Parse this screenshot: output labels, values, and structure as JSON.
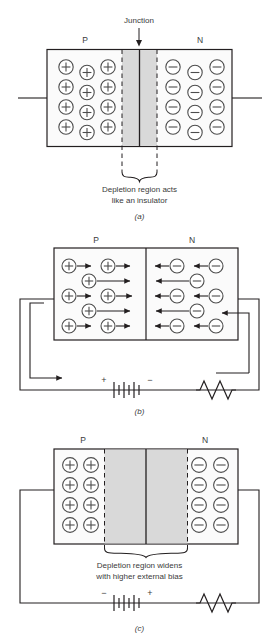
{
  "figure": {
    "colors": {
      "ink": "#231f20",
      "text": "#3a3a3a",
      "carrier_stroke": "#4d4d4d",
      "depletion_fill": "#d9d9d9",
      "body_fill": "#fbfbfb",
      "background": "#ffffff"
    },
    "panels": [
      {
        "id": "a",
        "panel_label": "(a)",
        "p_label": "P",
        "n_label": "N",
        "junction_label": "Junction",
        "junction_arrow": "down-arrow-icon",
        "caption_line1": "Depletion region acts",
        "caption_line2": "like an insulator",
        "brace": "curly-brace-down-icon",
        "p_carrier_symbol": "+",
        "n_carrier_symbol": "−",
        "p_carrier_count": 12,
        "n_carrier_count": 12,
        "p_carrier_rows": 4,
        "p_carrier_cols": 3,
        "has_arrows": false,
        "has_battery": false,
        "has_resistor": false,
        "depletion_width": "narrow",
        "leads": "two horizontal leads, left and right"
      },
      {
        "id": "b",
        "panel_label": "(b)",
        "p_label": "P",
        "n_label": "N",
        "p_carrier_symbol": "+",
        "n_carrier_symbol": "−",
        "p_carrier_count": 6,
        "n_carrier_count": 6,
        "has_arrows": true,
        "p_arrow_direction": "right",
        "n_arrow_direction": "left",
        "has_battery": true,
        "battery_left_terminal": "+",
        "battery_right_terminal": "−",
        "has_resistor": true,
        "resistor_symbol": "zigzag-resistor-icon",
        "current_arrow_left": "right-arrow-icon",
        "current_arrow_right": "left-arrow-icon",
        "depletion_width": "none",
        "caption_line1": "",
        "caption_line2": ""
      },
      {
        "id": "c",
        "panel_label": "(c)",
        "p_label": "P",
        "n_label": "N",
        "p_carrier_symbol": "+",
        "n_carrier_symbol": "−",
        "p_carrier_count": 8,
        "n_carrier_count": 8,
        "p_carrier_rows": 4,
        "p_carrier_cols": 2,
        "has_arrows": false,
        "has_battery": true,
        "battery_left_terminal": "−",
        "battery_right_terminal": "+",
        "has_resistor": true,
        "resistor_symbol": "zigzag-resistor-icon",
        "caption_line1": "Depletion region widens",
        "caption_line2": "with higher external bias",
        "brace": "curly-brace-down-icon",
        "depletion_width": "wide"
      }
    ]
  }
}
